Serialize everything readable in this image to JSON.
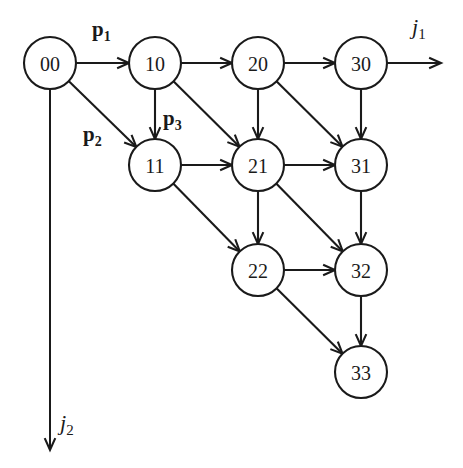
{
  "figure": {
    "type": "directed-lattice-graph",
    "background_color": "#ffffff",
    "stroke_color": "#1a1a1a",
    "node_radius": 26
  },
  "nodes": [
    {
      "id": "00",
      "label": "00",
      "cx": 50,
      "cy": 63,
      "col": 0,
      "row": 0
    },
    {
      "id": "10",
      "label": "10",
      "cx": 155,
      "cy": 63,
      "col": 1,
      "row": 0
    },
    {
      "id": "20",
      "label": "20",
      "cx": 258,
      "cy": 63,
      "col": 2,
      "row": 0
    },
    {
      "id": "30",
      "label": "30",
      "cx": 361,
      "cy": 63,
      "col": 3,
      "row": 0
    },
    {
      "id": "11",
      "label": "11",
      "cx": 155,
      "cy": 165,
      "col": 1,
      "row": 1
    },
    {
      "id": "21",
      "label": "21",
      "cx": 258,
      "cy": 165,
      "col": 2,
      "row": 1
    },
    {
      "id": "31",
      "label": "31",
      "cx": 361,
      "cy": 165,
      "col": 3,
      "row": 1
    },
    {
      "id": "22",
      "label": "22",
      "cx": 258,
      "cy": 270,
      "col": 2,
      "row": 2
    },
    {
      "id": "32",
      "label": "32",
      "cx": 361,
      "cy": 270,
      "col": 3,
      "row": 2
    },
    {
      "id": "33",
      "label": "33",
      "cx": 361,
      "cy": 372,
      "col": 3,
      "row": 3
    }
  ],
  "edges": [
    {
      "from": "00",
      "to": "10",
      "kind": "horizontal"
    },
    {
      "from": "10",
      "to": "20",
      "kind": "horizontal"
    },
    {
      "from": "20",
      "to": "30",
      "kind": "horizontal"
    },
    {
      "from": "11",
      "to": "21",
      "kind": "horizontal"
    },
    {
      "from": "21",
      "to": "31",
      "kind": "horizontal"
    },
    {
      "from": "22",
      "to": "32",
      "kind": "horizontal"
    },
    {
      "from": "10",
      "to": "11",
      "kind": "vertical"
    },
    {
      "from": "20",
      "to": "21",
      "kind": "vertical"
    },
    {
      "from": "30",
      "to": "31",
      "kind": "vertical"
    },
    {
      "from": "21",
      "to": "22",
      "kind": "vertical"
    },
    {
      "from": "31",
      "to": "32",
      "kind": "vertical"
    },
    {
      "from": "32",
      "to": "33",
      "kind": "vertical"
    },
    {
      "from": "00",
      "to": "11",
      "kind": "diagonal"
    },
    {
      "from": "10",
      "to": "21",
      "kind": "diagonal"
    },
    {
      "from": "20",
      "to": "31",
      "kind": "diagonal"
    },
    {
      "from": "11",
      "to": "22",
      "kind": "diagonal"
    },
    {
      "from": "21",
      "to": "32",
      "kind": "diagonal"
    },
    {
      "from": "22",
      "to": "33",
      "kind": "diagonal"
    }
  ],
  "axes": [
    {
      "id": "j1",
      "label_base": "j",
      "label_sub": "1",
      "direction": "right",
      "from_node": "30",
      "line": {
        "x1": 387,
        "y1": 63,
        "x2": 441,
        "y2": 63
      },
      "label_pos": {
        "left": 412,
        "top": 16
      }
    },
    {
      "id": "j2",
      "label_base": "j",
      "label_sub": "2",
      "direction": "down",
      "from_node": "00",
      "line": {
        "x1": 50,
        "y1": 89,
        "x2": 50,
        "y2": 450
      },
      "label_pos": {
        "left": 60,
        "top": 412
      }
    }
  ],
  "edge_labels": [
    {
      "id": "p1",
      "base": "p",
      "sub": "1",
      "for_edge": "00->10",
      "pos": {
        "left": 92,
        "top": 19
      }
    },
    {
      "id": "p2",
      "base": "p",
      "sub": "2",
      "for_edge": "00->11",
      "pos": {
        "left": 83,
        "top": 124
      }
    },
    {
      "id": "p3",
      "base": "p",
      "sub": "3",
      "for_edge": "10->11",
      "pos": {
        "left": 163,
        "top": 108
      }
    }
  ]
}
